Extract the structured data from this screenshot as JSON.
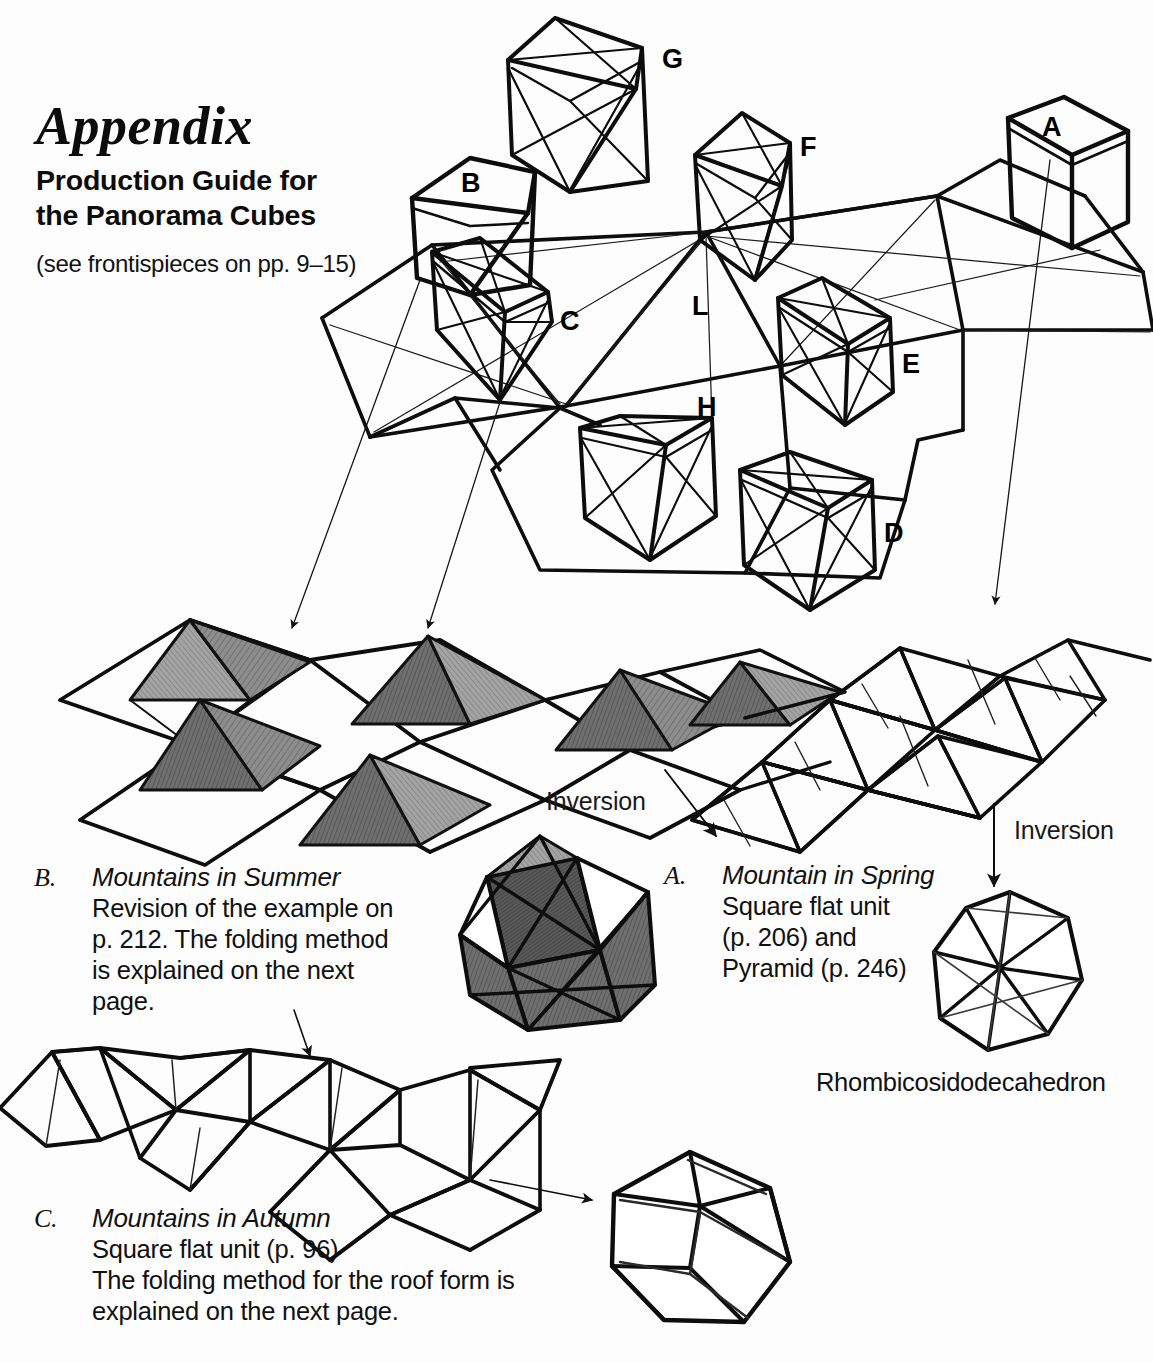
{
  "page": {
    "background": "#fdfdfd",
    "ink": "#000000"
  },
  "header": {
    "title": "Appendix",
    "subtitle_line1": "Production Guide for",
    "subtitle_line2": "the Panorama Cubes",
    "note": "(see frontispieces on pp. 9–15)"
  },
  "cube_diagram": {
    "name": "panorama-cubes-net",
    "labels": [
      {
        "id": "G",
        "text": "G",
        "x": 662,
        "y": 44
      },
      {
        "id": "A",
        "text": "A",
        "x": 1042,
        "y": 112
      },
      {
        "id": "F",
        "text": "F",
        "x": 800,
        "y": 132
      },
      {
        "id": "B",
        "text": "B",
        "x": 461,
        "y": 168
      },
      {
        "id": "C",
        "text": "C",
        "x": 560,
        "y": 306
      },
      {
        "id": "L",
        "text": "L",
        "x": 692,
        "y": 291
      },
      {
        "id": "E",
        "text": "E",
        "x": 902,
        "y": 349
      },
      {
        "id": "H",
        "text": "H",
        "x": 697,
        "y": 392
      },
      {
        "id": "D",
        "text": "D",
        "x": 884,
        "y": 518
      }
    ]
  },
  "annotations": {
    "inversion_left": "Inversion",
    "inversion_right": "Inversion",
    "polyhedron_name": "Rhombicosidodecahedron"
  },
  "captions": [
    {
      "id": "caption-b",
      "marker": "B.",
      "heading": "Mountains in Summer",
      "lines": [
        "Revision of the example on",
        "p. 212. The folding method",
        "is explained on the next",
        "page."
      ]
    },
    {
      "id": "caption-a",
      "marker": "A.",
      "heading": "Mountain in Spring",
      "lines": [
        "Square flat unit",
        "(p. 206)  and",
        "Pyramid (p. 246)"
      ]
    },
    {
      "id": "caption-c",
      "marker": "C.",
      "heading": "Mountains in Autumn",
      "lines": [
        "Square flat unit (p. 96)",
        "The folding method for the roof form is",
        "explained on the next page."
      ]
    }
  ],
  "figures": [
    {
      "id": "net-summer",
      "name": "mountains-in-summer-net"
    },
    {
      "id": "net-spring",
      "name": "mountain-in-spring-net"
    },
    {
      "id": "net-autumn",
      "name": "mountains-in-autumn-net"
    },
    {
      "id": "poly-summer",
      "name": "stellated-polyhedron-summer"
    },
    {
      "id": "poly-spring",
      "name": "rhombicosidodecahedron"
    },
    {
      "id": "poly-autumn",
      "name": "dodecahedron-autumn"
    }
  ]
}
